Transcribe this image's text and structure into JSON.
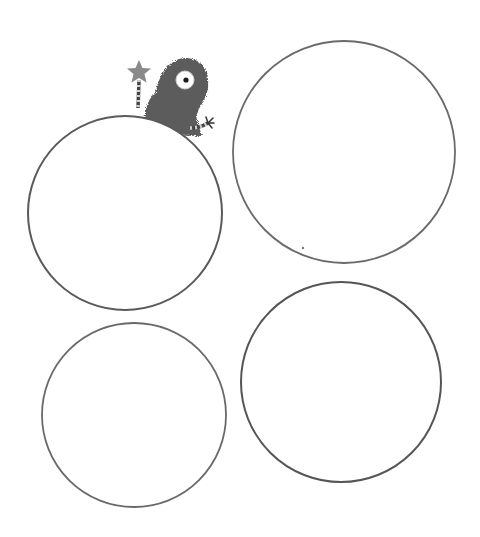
{
  "page": {
    "description": "Worksheet with four empty circles and a cartoon monster"
  },
  "colors": {
    "background": "#ffffff",
    "circle_stroke": "#5a5a5a",
    "monster_fur": "#5c5c5c",
    "star": "#8a8a8a",
    "eye_white": "#ffffff",
    "pupil": "#1a1a1a"
  },
  "circles": [
    {
      "id": "top-left",
      "cx": 125,
      "cy": 213,
      "r": 97
    },
    {
      "id": "top-right",
      "cx": 344,
      "cy": 152,
      "r": 111
    },
    {
      "id": "bottom-left",
      "cx": 134,
      "cy": 415,
      "r": 92
    },
    {
      "id": "bottom-right",
      "cx": 341,
      "cy": 382,
      "r": 100
    }
  ],
  "monster": {
    "eye": {
      "cx": 185,
      "cy": 80,
      "r": 8
    },
    "star": {
      "cx": 139,
      "cy": 72
    },
    "hand": {
      "x": 209,
      "y": 123
    }
  },
  "stray_dot": {
    "x": 303,
    "y": 248
  }
}
